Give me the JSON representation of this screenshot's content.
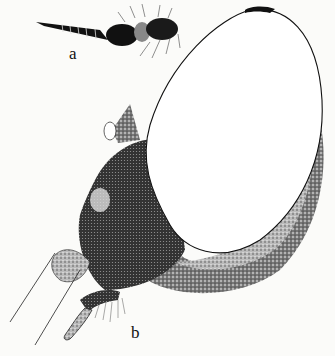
{
  "figure": {
    "panels": [
      {
        "id": "a",
        "label": "a",
        "description": "segmented elongate structure with setae"
      },
      {
        "id": "b",
        "label": "b",
        "description": "large oval structure with stippled curved base and appendage"
      }
    ],
    "colors": {
      "background": "#fbfbf9",
      "ink": "#111111"
    }
  }
}
